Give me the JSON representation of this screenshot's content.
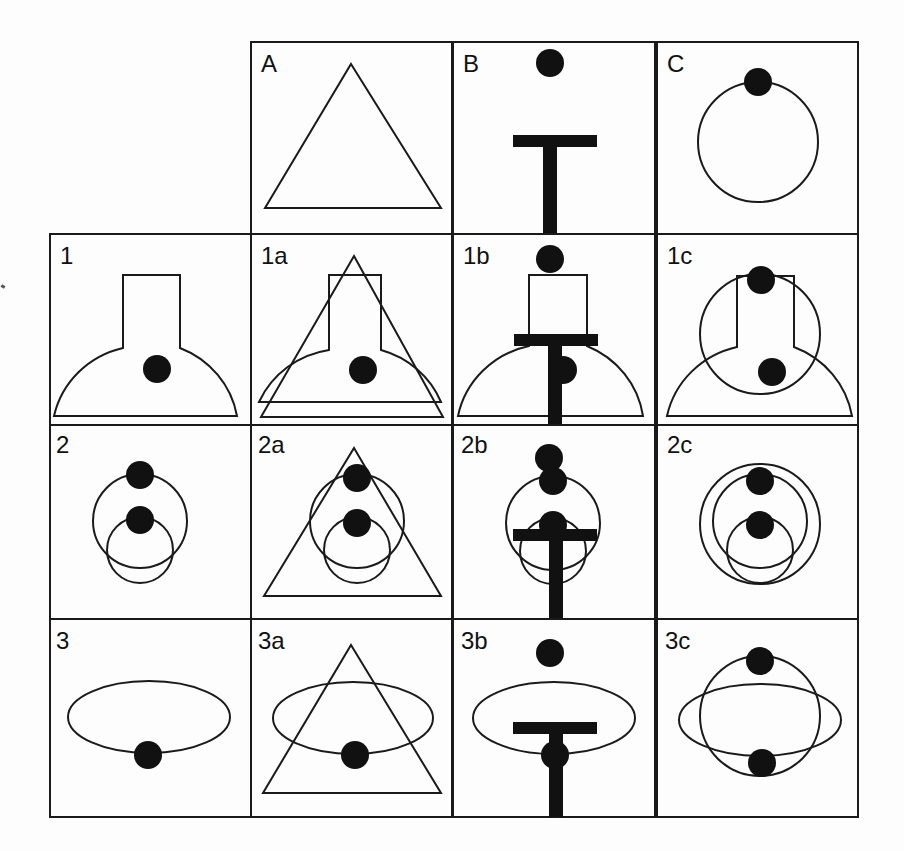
{
  "figure": {
    "title": "",
    "stroke_color": "#1a1a1a",
    "fill_color": "#111111",
    "background": "#fdfdfd",
    "grid": {
      "col_x": [
        50,
        251,
        453,
        657
      ],
      "row_y": [
        42,
        234,
        425,
        619
      ],
      "cell_w": [
        201,
        202,
        204,
        201
      ],
      "cell_h": [
        192,
        191,
        194,
        198
      ]
    },
    "cells": [
      {
        "id": "A",
        "label": "A",
        "col": 1,
        "row": 0,
        "shapes": [
          {
            "type": "polygon",
            "points": "85,32 150,22 190,180"
          }
        ]
      },
      {
        "id": "B",
        "label": "B",
        "col": 2,
        "row": 0,
        "shapes": []
      },
      {
        "id": "C",
        "label": "C",
        "col": 3,
        "row": 0,
        "shapes": []
      },
      {
        "id": "1",
        "label": "1",
        "col": 0,
        "row": 1,
        "shapes": []
      },
      {
        "id": "1a",
        "label": "1a",
        "col": 1,
        "row": 1,
        "shapes": []
      },
      {
        "id": "1b",
        "label": "1b",
        "col": 2,
        "row": 1,
        "shapes": []
      },
      {
        "id": "1c",
        "label": "1c",
        "col": 3,
        "row": 1,
        "shapes": []
      },
      {
        "id": "2",
        "label": "2",
        "col": 0,
        "row": 2,
        "shapes": []
      },
      {
        "id": "2a",
        "label": "2a",
        "col": 1,
        "row": 2,
        "shapes": []
      },
      {
        "id": "2b",
        "label": "2b",
        "col": 2,
        "row": 2,
        "shapes": []
      },
      {
        "id": "2c",
        "label": "2c",
        "col": 3,
        "row": 2,
        "shapes": []
      },
      {
        "id": "3",
        "label": "3",
        "col": 0,
        "row": 3,
        "shapes": []
      },
      {
        "id": "3a",
        "label": "3a",
        "col": 1,
        "row": 3,
        "shapes": []
      },
      {
        "id": "3b",
        "label": "3b",
        "col": 2,
        "row": 3,
        "shapes": []
      },
      {
        "id": "3c",
        "label": "3c",
        "col": 3,
        "row": 3,
        "shapes": []
      }
    ],
    "labels": {
      "A": "A",
      "B": "B",
      "C": "C",
      "r1": "1",
      "r1a": "1a",
      "r1b": "1b",
      "r1c": "1c",
      "r2": "2",
      "r2a": "2a",
      "r2b": "2b",
      "r2c": "2c",
      "r3": "3",
      "r3a": "3a",
      "r3b": "3b",
      "r3c": "3c"
    },
    "primitives": {
      "triangle": "triangle outline",
      "t_bar": "thick T-shaped bar",
      "dot": "filled black circle",
      "circle": "circle outline",
      "bell": "semicircular dome with rectangular neck",
      "ellipse": "horizontal ellipse outline"
    }
  }
}
